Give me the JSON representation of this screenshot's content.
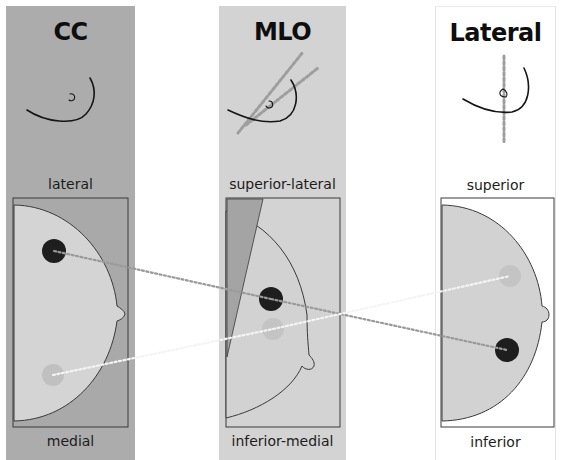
{
  "panels": {
    "cc": {
      "title": "CC",
      "label_top": "lateral",
      "label_bottom": "medial",
      "background": "#acacac"
    },
    "mlo": {
      "title": "MLO",
      "label_top": "superior-lateral",
      "label_bottom": "inferior-medial",
      "background": "#d3d3d3"
    },
    "lateral": {
      "title": "Lateral",
      "label_top": "superior",
      "label_bottom": "inferior",
      "background": "#ffffff"
    }
  },
  "colors": {
    "breast_fill": "#d2d2d2",
    "breast_fill_cc": "#d4d4d4",
    "lesion_dark": "#1e1e1e",
    "lesion_faint": "#bdbdbd",
    "pectoral_wedge": "#a4a4a4",
    "dotted_dark": "#9a9a9a",
    "dotted_light": "#f4f4f4",
    "outline": "#3a3a3a"
  }
}
